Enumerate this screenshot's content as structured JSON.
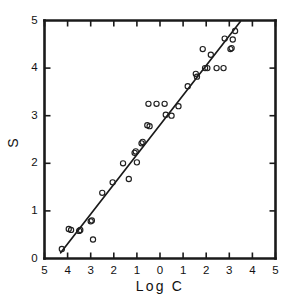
{
  "chart_data": {
    "type": "scatter",
    "title": "",
    "xlabel": "Log  C",
    "ylabel": "S",
    "xlim": [
      -5,
      5
    ],
    "ylim": [
      0,
      5
    ],
    "grid": false,
    "legend": null,
    "x_tick_labels": [
      "5",
      "4",
      "3",
      "2",
      "1",
      "0",
      "1",
      "2",
      "3",
      "4",
      "5"
    ],
    "x_tick_values": [
      -5,
      -4,
      -3,
      -2,
      -1,
      0,
      1,
      2,
      3,
      4,
      5
    ],
    "y_tick_labels": [
      "0",
      "1",
      "2",
      "3",
      "4",
      "5"
    ],
    "y_tick_values": [
      0,
      1,
      2,
      3,
      4,
      5
    ],
    "x_note": "Tick labels left of 0 are negative; minus signs are not printed on the scan",
    "points": [
      {
        "x": -4.25,
        "y": 0.2
      },
      {
        "x": -3.95,
        "y": 0.62
      },
      {
        "x": -3.85,
        "y": 0.6
      },
      {
        "x": -3.5,
        "y": 0.58
      },
      {
        "x": -3.45,
        "y": 0.6
      },
      {
        "x": -3.0,
        "y": 0.78
      },
      {
        "x": -2.95,
        "y": 0.8
      },
      {
        "x": -2.9,
        "y": 0.4
      },
      {
        "x": -2.5,
        "y": 1.38
      },
      {
        "x": -2.05,
        "y": 1.6
      },
      {
        "x": -1.6,
        "y": 2.0
      },
      {
        "x": -1.35,
        "y": 1.67
      },
      {
        "x": -1.1,
        "y": 2.22
      },
      {
        "x": -1.05,
        "y": 2.25
      },
      {
        "x": -1.0,
        "y": 2.02
      },
      {
        "x": -0.8,
        "y": 2.42
      },
      {
        "x": -0.75,
        "y": 2.45
      },
      {
        "x": -0.55,
        "y": 2.8
      },
      {
        "x": -0.5,
        "y": 3.25
      },
      {
        "x": -0.45,
        "y": 2.78
      },
      {
        "x": -0.15,
        "y": 3.25
      },
      {
        "x": 0.2,
        "y": 3.25
      },
      {
        "x": 0.25,
        "y": 3.02
      },
      {
        "x": 0.5,
        "y": 3.0
      },
      {
        "x": 0.8,
        "y": 3.2
      },
      {
        "x": 1.2,
        "y": 3.62
      },
      {
        "x": 1.55,
        "y": 3.88
      },
      {
        "x": 1.6,
        "y": 3.82
      },
      {
        "x": 1.85,
        "y": 4.4
      },
      {
        "x": 1.95,
        "y": 4.0
      },
      {
        "x": 2.05,
        "y": 4.0
      },
      {
        "x": 2.2,
        "y": 4.28
      },
      {
        "x": 2.45,
        "y": 4.0
      },
      {
        "x": 2.75,
        "y": 4.0
      },
      {
        "x": 2.8,
        "y": 4.62
      },
      {
        "x": 3.05,
        "y": 4.4
      },
      {
        "x": 3.1,
        "y": 4.42
      },
      {
        "x": 3.15,
        "y": 4.6
      },
      {
        "x": 3.25,
        "y": 4.78
      }
    ],
    "fit_line": {
      "x_start": -4.3,
      "y_start": 0.12,
      "x_end": 3.48,
      "y_end": 4.98,
      "style": "solid"
    }
  }
}
